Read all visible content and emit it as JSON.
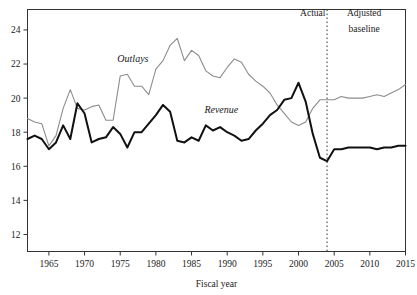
{
  "chart_data": {
    "type": "line",
    "title": "",
    "subtitle": "",
    "xlabel": "Fiscal year",
    "ylabel": "",
    "xlim": [
      1962,
      2015
    ],
    "ylim": [
      11,
      25.2
    ],
    "grid": false,
    "legend_position": "inline-annotation",
    "yticks": [
      12,
      14,
      16,
      18,
      20,
      22,
      24
    ],
    "ytick_labels": [
      "12",
      "14",
      "16",
      "18",
      "20",
      "22",
      "24"
    ],
    "xticks": [
      1965,
      1970,
      1975,
      1980,
      1985,
      1990,
      1995,
      2000,
      2005,
      2010,
      2015
    ],
    "xtick_labels": [
      "1965",
      "1970",
      "1975",
      "1980",
      "1985",
      "1990",
      "1995",
      "2000",
      "2005",
      "2010",
      "2015"
    ],
    "x": [
      1962,
      1963,
      1964,
      1965,
      1966,
      1967,
      1968,
      1969,
      1970,
      1971,
      1972,
      1973,
      1974,
      1975,
      1976,
      1977,
      1978,
      1979,
      1980,
      1981,
      1982,
      1983,
      1984,
      1985,
      1986,
      1987,
      1988,
      1989,
      1990,
      1991,
      1992,
      1993,
      1994,
      1995,
      1996,
      1997,
      1998,
      1999,
      2000,
      2001,
      2002,
      2003,
      2004,
      2005,
      2006,
      2007,
      2008,
      2009,
      2010,
      2011,
      2012,
      2013,
      2014,
      2015
    ],
    "series": [
      {
        "name": "Outlays",
        "color": "#8c8c8c",
        "line_width": 1.1,
        "values": [
          18.8,
          18.6,
          18.5,
          17.2,
          17.8,
          19.4,
          20.5,
          19.4,
          19.3,
          19.5,
          19.6,
          18.7,
          18.7,
          21.3,
          21.4,
          20.7,
          20.7,
          20.2,
          21.7,
          22.2,
          23.1,
          23.5,
          22.2,
          22.8,
          22.5,
          21.6,
          21.3,
          21.2,
          21.8,
          22.3,
          22.1,
          21.4,
          21.0,
          20.7,
          20.3,
          19.6,
          19.1,
          18.6,
          18.4,
          18.6,
          19.4,
          19.9,
          19.9,
          19.9,
          20.1,
          20.0,
          20.0,
          20.0,
          20.1,
          20.2,
          20.1,
          20.3,
          20.5,
          20.8
        ]
      },
      {
        "name": "Revenue",
        "color": "#111111",
        "line_width": 2.0,
        "values": [
          17.6,
          17.8,
          17.6,
          17.0,
          17.4,
          18.4,
          17.6,
          19.7,
          19.1,
          17.4,
          17.6,
          17.7,
          18.3,
          17.9,
          17.1,
          18.0,
          18.0,
          18.5,
          19.0,
          19.6,
          19.2,
          17.5,
          17.4,
          17.7,
          17.5,
          18.4,
          18.1,
          18.3,
          18.0,
          17.8,
          17.5,
          17.6,
          18.1,
          18.5,
          19.0,
          19.3,
          19.9,
          20.0,
          20.9,
          19.8,
          17.9,
          16.5,
          16.3,
          17.0,
          17.0,
          17.1,
          17.1,
          17.1,
          17.1,
          17.0,
          17.1,
          17.1,
          17.2,
          17.2
        ]
      }
    ],
    "annotations": [
      {
        "name": "actual-region-label",
        "text": "Actual",
        "x": 2002.0,
        "y": 24.8
      },
      {
        "name": "adjusted-baseline-region-label-line1",
        "text": "Adjusted",
        "x": 2009.2,
        "y": 24.8
      },
      {
        "name": "adjusted-baseline-region-label-line2",
        "text": "baseline",
        "x": 2009.2,
        "y": 23.9
      },
      {
        "name": "outlays-series-label",
        "text": "Outlays",
        "x": 1974.6,
        "y": 22.1
      },
      {
        "name": "revenue-series-label",
        "text": "Revenue",
        "x": 1986.8,
        "y": 19.15
      }
    ],
    "divider": {
      "name": "actual-vs-baseline-divider",
      "x": 2004,
      "style": "dotted",
      "color": "#333333"
    }
  }
}
